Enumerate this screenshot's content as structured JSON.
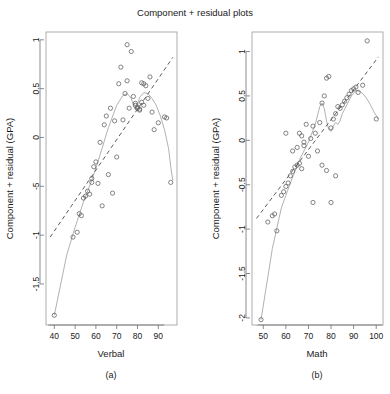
{
  "chart_data": [
    {
      "type": "scatter",
      "title": "Component + residual plots",
      "panel_label": "(a)",
      "xlabel": "Verbal",
      "ylabel": "Component + residual (GPA)",
      "xlim": [
        36,
        99
      ],
      "ylim": [
        -1.92,
        1.08
      ],
      "xticks": [
        40,
        50,
        60,
        70,
        80,
        90
      ],
      "yticks": [
        1.0,
        0.5,
        0.0,
        -5.0,
        -1.0,
        -1.5
      ],
      "ytick_values": [
        1.0,
        0.5,
        0.0,
        -0.5,
        -1.0,
        -1.5
      ],
      "grid": false,
      "legend": "none",
      "points": [
        [
          40,
          -1.82
        ],
        [
          49,
          -1.02
        ],
        [
          51,
          -0.97
        ],
        [
          52,
          -0.78
        ],
        [
          53,
          -0.8
        ],
        [
          54,
          -0.62
        ],
        [
          55,
          -0.6
        ],
        [
          56,
          -0.55
        ],
        [
          57,
          -0.58
        ],
        [
          58,
          -0.42
        ],
        [
          58,
          -0.46
        ],
        [
          59,
          -0.3
        ],
        [
          60,
          -0.25
        ],
        [
          61,
          -0.47
        ],
        [
          62,
          -0.05
        ],
        [
          63,
          -0.7
        ],
        [
          64,
          0.13
        ],
        [
          65,
          0.22
        ],
        [
          66,
          -0.38
        ],
        [
          67,
          0.3
        ],
        [
          68,
          -0.57
        ],
        [
          69,
          0.17
        ],
        [
          70,
          -0.2
        ],
        [
          71,
          0.55
        ],
        [
          72,
          0.72
        ],
        [
          73,
          0.18
        ],
        [
          74,
          0.45
        ],
        [
          75,
          0.58
        ],
        [
          76,
          0.3
        ],
        [
          77,
          0.88
        ],
        [
          78,
          0.42
        ],
        [
          79,
          0.35
        ],
        [
          79,
          0.33
        ],
        [
          80,
          0.31
        ],
        [
          80,
          0.3
        ],
        [
          81,
          0.29
        ],
        [
          81,
          0.28
        ],
        [
          82,
          0.56
        ],
        [
          82,
          0.36
        ],
        [
          83,
          0.33
        ],
        [
          83,
          0.55
        ],
        [
          84,
          0.53
        ],
        [
          85,
          0.4
        ],
        [
          86,
          0.62
        ],
        [
          87,
          0.26
        ],
        [
          88,
          0.08
        ],
        [
          90,
          0.15
        ],
        [
          93,
          0.21
        ],
        [
          94,
          0.2
        ],
        [
          96,
          -0.46
        ],
        [
          75,
          0.95
        ]
      ],
      "fit_line": [
        [
          38,
          -1.02
        ],
        [
          97,
          0.82
        ]
      ],
      "smooth_line": [
        [
          40,
          -1.82
        ],
        [
          46,
          -1.2
        ],
        [
          50,
          -0.92
        ],
        [
          54,
          -0.66
        ],
        [
          58,
          -0.44
        ],
        [
          62,
          -0.18
        ],
        [
          66,
          0.1
        ],
        [
          70,
          0.33
        ],
        [
          73,
          0.43
        ],
        [
          75,
          0.45
        ],
        [
          77,
          0.4
        ],
        [
          78,
          0.33
        ],
        [
          79,
          0.28
        ],
        [
          80,
          0.33
        ],
        [
          81,
          0.41
        ],
        [
          83,
          0.46
        ],
        [
          85,
          0.45
        ],
        [
          87,
          0.4
        ],
        [
          89,
          0.33
        ],
        [
          91,
          0.22
        ],
        [
          93,
          0.08
        ],
        [
          95,
          -0.12
        ],
        [
          96,
          -0.3
        ],
        [
          97,
          -0.44
        ]
      ]
    },
    {
      "type": "scatter",
      "title": "Component + residual plots",
      "panel_label": "(b)",
      "xlabel": "Math",
      "ylabel": "Component + residual (GPA)",
      "xlim": [
        45,
        103
      ],
      "ylim": [
        -2.08,
        1.22
      ],
      "xticks": [
        50,
        60,
        70,
        80,
        90,
        100
      ],
      "yticks": [
        1.0,
        0.5,
        0.0,
        -0.5,
        -1.0,
        -1.5,
        -2.0
      ],
      "grid": false,
      "legend": "none",
      "points": [
        [
          49,
          -2.02
        ],
        [
          52,
          -0.92
        ],
        [
          54,
          -0.85
        ],
        [
          55,
          -0.83
        ],
        [
          56,
          -1.02
        ],
        [
          58,
          -0.62
        ],
        [
          59,
          -0.58
        ],
        [
          60,
          -0.52
        ],
        [
          61,
          -0.48
        ],
        [
          62,
          -0.4
        ],
        [
          63,
          -0.35
        ],
        [
          64,
          -0.3
        ],
        [
          65,
          -0.28
        ],
        [
          66,
          -0.26
        ],
        [
          67,
          -0.32
        ],
        [
          63,
          -0.12
        ],
        [
          65,
          -0.08
        ],
        [
          67,
          0.05
        ],
        [
          68,
          -0.06
        ],
        [
          69,
          0.18
        ],
        [
          70,
          -0.18
        ],
        [
          71,
          0.02
        ],
        [
          72,
          0.16
        ],
        [
          73,
          0.08
        ],
        [
          74,
          -0.12
        ],
        [
          75,
          0.2
        ],
        [
          76,
          0.42
        ],
        [
          77,
          0.5
        ],
        [
          78,
          0.7
        ],
        [
          79,
          0.72
        ],
        [
          80,
          0.14
        ],
        [
          81,
          0.24
        ],
        [
          82,
          0.3
        ],
        [
          83,
          0.38
        ],
        [
          84,
          0.36
        ],
        [
          85,
          0.4
        ],
        [
          86,
          0.44
        ],
        [
          87,
          0.48
        ],
        [
          88,
          0.52
        ],
        [
          89,
          0.56
        ],
        [
          90,
          0.58
        ],
        [
          91,
          0.6
        ],
        [
          92,
          0.54
        ],
        [
          94,
          0.62
        ],
        [
          96,
          1.12
        ],
        [
          100,
          0.24
        ],
        [
          72,
          -0.7
        ],
        [
          80,
          -0.7
        ],
        [
          76,
          -0.28
        ],
        [
          78,
          -0.34
        ],
        [
          82,
          -0.4
        ],
        [
          60,
          0.08
        ],
        [
          66,
          0.08
        ],
        [
          68,
          -0.02
        ]
      ],
      "fit_line": [
        [
          47,
          -0.88
        ],
        [
          101,
          0.94
        ]
      ],
      "smooth_line": [
        [
          49,
          -2.02
        ],
        [
          54,
          -1.22
        ],
        [
          58,
          -0.76
        ],
        [
          62,
          -0.48
        ],
        [
          66,
          -0.22
        ],
        [
          70,
          -0.02
        ],
        [
          73,
          0.18
        ],
        [
          75,
          0.38
        ],
        [
          76,
          0.42
        ],
        [
          77,
          0.36
        ],
        [
          78,
          0.22
        ],
        [
          79,
          0.12
        ],
        [
          80,
          0.1
        ],
        [
          81,
          0.16
        ],
        [
          82,
          0.2
        ],
        [
          83,
          0.18
        ],
        [
          84,
          0.22
        ],
        [
          85,
          0.3
        ],
        [
          87,
          0.4
        ],
        [
          89,
          0.5
        ],
        [
          91,
          0.56
        ],
        [
          93,
          0.55
        ],
        [
          95,
          0.5
        ],
        [
          97,
          0.42
        ],
        [
          99,
          0.32
        ],
        [
          101,
          0.24
        ]
      ]
    }
  ],
  "figure": {
    "title": "Component + residual plots"
  }
}
